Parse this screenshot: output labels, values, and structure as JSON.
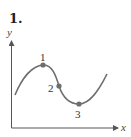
{
  "problem": {
    "number": "1."
  },
  "axes": {
    "x_label": "x",
    "y_label": "y"
  },
  "points": [
    {
      "label": "1"
    },
    {
      "label": "2"
    },
    {
      "label": "3"
    }
  ],
  "colors": {
    "curve": "#6e6e6e",
    "point": "#6e6e6e",
    "axis": "#555555"
  }
}
